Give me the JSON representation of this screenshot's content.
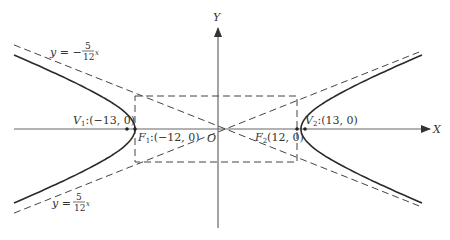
{
  "diagram": {
    "type": "hyperbola",
    "equation_params": {
      "a": 13,
      "b": 5,
      "c": 12
    },
    "axes": {
      "x_label": "X",
      "y_label": "Y",
      "origin_label": "O"
    },
    "points": [
      {
        "id": "V1",
        "label_main": "V",
        "label_sub": "1",
        "label_rest": ":(−13, 0)",
        "x": -13,
        "y": 0
      },
      {
        "id": "V2",
        "label_main": "V",
        "label_sub": "2",
        "label_rest": ":(13, 0)",
        "x": 13,
        "y": 0
      },
      {
        "id": "F1",
        "label_main": "F",
        "label_sub": "1",
        "label_rest": ":(−12, 0)",
        "x": -12,
        "y": 0
      },
      {
        "id": "F2",
        "label_main": "F",
        "label_sub": "2",
        "label_rest": "(12, 0)",
        "x": 12,
        "y": 0
      }
    ],
    "asymptotes": [
      {
        "id": "upper",
        "lhs": "y = −",
        "num": "5",
        "den": "12",
        "var": "x",
        "slope": -0.4167
      },
      {
        "id": "lower",
        "lhs": "y = ",
        "num": "5",
        "den": "12",
        "var": "x",
        "slope": 0.4167
      }
    ],
    "colors": {
      "curve": "#2a2a2a",
      "axis": "#555555",
      "dashed": "#444444",
      "text": "#333333"
    }
  }
}
